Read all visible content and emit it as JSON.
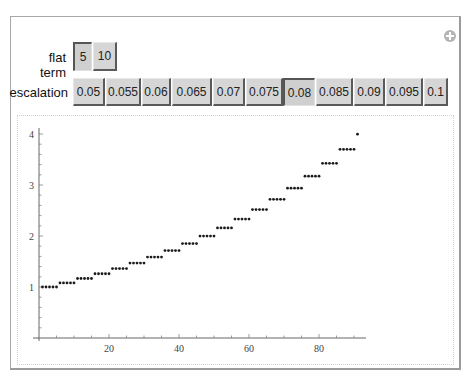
{
  "controls": {
    "flat_term": {
      "label": "flat term",
      "options": [
        "5",
        "10"
      ],
      "selected": "5"
    },
    "escalation": {
      "label": "escalation",
      "options": [
        "0.05",
        "0.055",
        "0.06",
        "0.065",
        "0.07",
        "0.075",
        "0.08",
        "0.085",
        "0.09",
        "0.095",
        "0.1"
      ],
      "selected": "0.08"
    }
  },
  "icons": {
    "add": "plus-circle-icon"
  },
  "chart_data": {
    "type": "scatter",
    "title": "",
    "xlabel": "",
    "ylabel": "",
    "xlim": [
      0,
      93
    ],
    "ylim": [
      0,
      4.1
    ],
    "grid": false,
    "legend": null,
    "x_ticks": [
      20,
      40,
      60,
      80
    ],
    "y_ticks": [
      1,
      2,
      3,
      4
    ],
    "step_values": [
      1,
      1.08,
      1.1664,
      1.2597,
      1.3605,
      1.4693,
      1.5869,
      1.7138,
      1.8509,
      1.999,
      2.1589,
      2.3316,
      2.5182,
      2.7196,
      2.9372,
      3.1722,
      3.4259,
      3.7,
      3.996
    ],
    "points_per_step": 5,
    "x_start": 1,
    "x_end": 91
  }
}
